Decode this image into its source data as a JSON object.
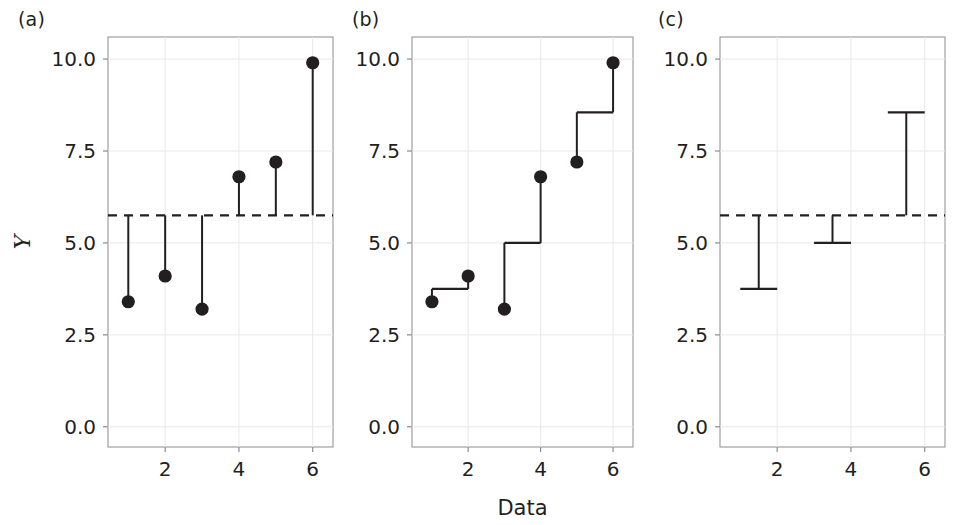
{
  "figure": {
    "background": "#ffffff",
    "ink_color": "#231f20",
    "grid_color": "#e8e8e8",
    "axis_color": "#8c8c8c"
  },
  "panels": [
    {
      "id": "a",
      "label": "(a)",
      "show_y_axis_title": true,
      "show_x_axis_title": false,
      "description": "Individual observations with vertical deviation lines drawn from the grand mean to each point",
      "chart_data": {
        "type": "scatter",
        "title": "",
        "xlabel": "",
        "ylabel": "Y",
        "x": [
          1,
          2,
          3,
          4,
          5,
          6
        ],
        "values": [
          3.4,
          4.1,
          3.2,
          6.8,
          7.2,
          9.9
        ],
        "xlim": [
          0.45,
          6.55
        ],
        "ylim": [
          -0.55,
          10.6
        ],
        "xticks": [
          2,
          4,
          6
        ],
        "xticklabels": [
          "2",
          "4",
          "6"
        ],
        "yticks": [
          0.0,
          2.5,
          5.0,
          7.5,
          10.0
        ],
        "yticklabels": [
          "0.0",
          "2.5",
          "5.0",
          "7.5",
          "10.0"
        ],
        "grid": true,
        "reference_lines": [
          {
            "name": "grand-mean",
            "y": 5.75,
            "style": "dashed"
          }
        ],
        "segments": [
          {
            "name": "deviation-1",
            "x": 1,
            "y_from": 5.75,
            "y_to": 3.4
          },
          {
            "name": "deviation-2",
            "x": 2,
            "y_from": 5.75,
            "y_to": 4.1
          },
          {
            "name": "deviation-3",
            "x": 3,
            "y_from": 5.75,
            "y_to": 3.2
          },
          {
            "name": "deviation-4",
            "x": 4,
            "y_from": 5.75,
            "y_to": 6.8
          },
          {
            "name": "deviation-5",
            "x": 5,
            "y_from": 5.75,
            "y_to": 7.2
          },
          {
            "name": "deviation-6",
            "x": 6,
            "y_from": 5.75,
            "y_to": 9.9
          }
        ]
      }
    },
    {
      "id": "b",
      "label": "(b)",
      "show_y_axis_title": false,
      "show_x_axis_title": true,
      "description": "Observations joined within pairs by a step connector at each pair mean",
      "chart_data": {
        "type": "scatter",
        "title": "",
        "xlabel": "Data",
        "ylabel": "",
        "x": [
          1,
          2,
          3,
          4,
          5,
          6
        ],
        "values": [
          3.4,
          4.1,
          3.2,
          6.8,
          7.2,
          9.9
        ],
        "xlim": [
          0.45,
          6.55
        ],
        "ylim": [
          -0.55,
          10.6
        ],
        "xticks": [
          2,
          4,
          6
        ],
        "xticklabels": [
          "2",
          "4",
          "6"
        ],
        "yticks": [
          0.0,
          2.5,
          5.0,
          7.5,
          10.0
        ],
        "yticklabels": [
          "0.0",
          "2.5",
          "5.0",
          "7.5",
          "10.0"
        ],
        "grid": true,
        "reference_lines": [],
        "pair_means": [
          {
            "name": "pair-mean-1",
            "x_from": 1,
            "x_to": 2,
            "y": 3.75
          },
          {
            "name": "pair-mean-2",
            "x_from": 3,
            "x_to": 4,
            "y": 5.0
          },
          {
            "name": "pair-mean-3",
            "x_from": 5,
            "x_to": 6,
            "y": 8.55
          }
        ],
        "segments": [
          {
            "name": "pair-stem-1a",
            "x": 1,
            "y_from": 3.4,
            "y_to": 3.75
          },
          {
            "name": "pair-stem-1b",
            "x": 2,
            "y_from": 4.1,
            "y_to": 3.75
          },
          {
            "name": "pair-stem-2a",
            "x": 3,
            "y_from": 3.2,
            "y_to": 5.0
          },
          {
            "name": "pair-stem-2b",
            "x": 4,
            "y_from": 6.8,
            "y_to": 5.0
          },
          {
            "name": "pair-stem-3a",
            "x": 5,
            "y_from": 7.2,
            "y_to": 8.55
          },
          {
            "name": "pair-stem-3b",
            "x": 6,
            "y_from": 9.9,
            "y_to": 8.55
          }
        ]
      }
    },
    {
      "id": "c",
      "label": "(c)",
      "show_y_axis_title": false,
      "show_x_axis_title": false,
      "description": "Pair means shown as capped I-beams with stems running to the grand mean",
      "chart_data": {
        "type": "scatter",
        "title": "",
        "xlabel": "",
        "ylabel": "",
        "x": [],
        "values": [],
        "xlim": [
          0.45,
          6.55
        ],
        "ylim": [
          -0.55,
          10.6
        ],
        "xticks": [
          2,
          4,
          6
        ],
        "xticklabels": [
          "2",
          "4",
          "6"
        ],
        "yticks": [
          0.0,
          2.5,
          5.0,
          7.5,
          10.0
        ],
        "yticklabels": [
          "0.0",
          "2.5",
          "5.0",
          "7.5",
          "10.0"
        ],
        "grid": true,
        "reference_lines": [
          {
            "name": "grand-mean",
            "y": 5.75,
            "style": "dashed"
          }
        ],
        "pair_means": [
          {
            "name": "pair-mean-1",
            "x_from": 1,
            "x_to": 2,
            "x_center": 1.5,
            "y": 3.75
          },
          {
            "name": "pair-mean-2",
            "x_from": 3,
            "x_to": 4,
            "x_center": 3.5,
            "y": 5.0
          },
          {
            "name": "pair-mean-3",
            "x_from": 5,
            "x_to": 6,
            "x_center": 5.5,
            "y": 8.55
          }
        ],
        "segments": [
          {
            "name": "pair-stem-1",
            "x": 1.5,
            "y_from": 5.75,
            "y_to": 3.75
          },
          {
            "name": "pair-stem-2",
            "x": 3.5,
            "y_from": 5.75,
            "y_to": 5.0
          },
          {
            "name": "pair-stem-3",
            "x": 5.5,
            "y_from": 5.75,
            "y_to": 8.55
          }
        ]
      }
    }
  ]
}
